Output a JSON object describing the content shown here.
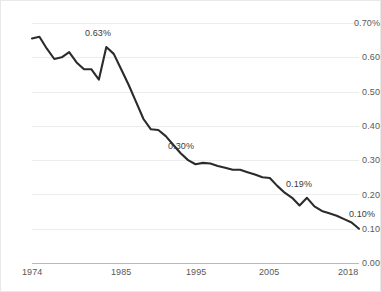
{
  "chart_data": {
    "type": "line",
    "title": "",
    "subtitle": "",
    "xlabel": "",
    "ylabel": "",
    "xlim": [
      1974,
      2018
    ],
    "ylim": [
      0.0,
      0.7
    ],
    "grid": true,
    "legend": "none",
    "y_tick_labels": [
      "0.70%",
      "0.60",
      "0.50",
      "0.40",
      "0.30",
      "0.20",
      "0.10",
      "0.00"
    ],
    "y_ticks": [
      0.7,
      0.6,
      0.5,
      0.4,
      0.3,
      0.2,
      0.1,
      0.0
    ],
    "x_tick_labels": [
      "1974",
      "1985",
      "1995",
      "2005",
      "2018"
    ],
    "x_ticks": [
      1974,
      1985,
      1995,
      2005,
      2018
    ],
    "line_color": "#2b2b2b",
    "grid_color": "#ececec",
    "axis_color": "#b9b9b9",
    "label_color": "#585858",
    "x": [
      1974,
      1975,
      1976,
      1977,
      1978,
      1979,
      1980,
      1981,
      1982,
      1983,
      1984,
      1985,
      1986,
      1987,
      1988,
      1989,
      1990,
      1991,
      1992,
      1993,
      1994,
      1995,
      1996,
      1997,
      1998,
      1999,
      2000,
      2001,
      2002,
      2003,
      2004,
      2005,
      2006,
      2007,
      2008,
      2009,
      2010,
      2011,
      2012,
      2013,
      2014,
      2015,
      2016,
      2017,
      2018
    ],
    "values": [
      0.655,
      0.66,
      0.625,
      0.595,
      0.6,
      0.615,
      0.585,
      0.565,
      0.565,
      0.535,
      0.63,
      0.61,
      0.565,
      0.52,
      0.47,
      0.42,
      0.39,
      0.388,
      0.37,
      0.345,
      0.32,
      0.3,
      0.288,
      0.292,
      0.29,
      0.283,
      0.278,
      0.272,
      0.272,
      0.265,
      0.258,
      0.25,
      0.248,
      0.225,
      0.205,
      0.19,
      0.168,
      0.19,
      0.165,
      0.152,
      0.145,
      0.138,
      0.128,
      0.118,
      0.1
    ],
    "annotations": [
      {
        "label": "0.63%",
        "x": 1984,
        "y": 0.63
      },
      {
        "label": "0.30%",
        "x": 1995,
        "y": 0.3
      },
      {
        "label": "0.19%",
        "x": 2011,
        "y": 0.19
      },
      {
        "label": "0.10%",
        "x": 2018,
        "y": 0.1
      }
    ]
  }
}
